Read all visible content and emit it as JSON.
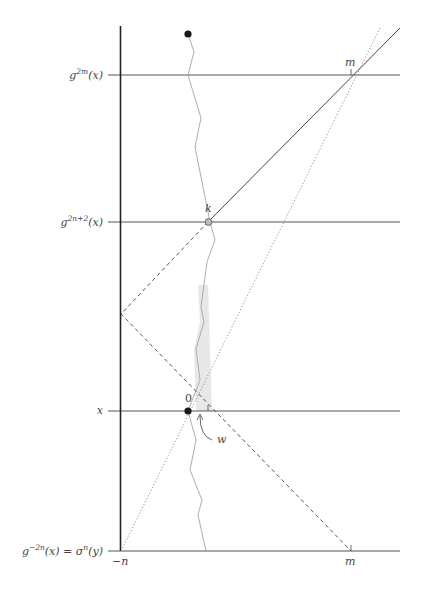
{
  "diagram": {
    "row_labels": [
      {
        "id": "g2m",
        "base": "g",
        "sup": "2m",
        "tail": "(x)",
        "y": 75
      },
      {
        "id": "g2n2",
        "base": "g",
        "sup": "2n+2",
        "tail": "(x)",
        "y": 222
      },
      {
        "id": "x",
        "base": "x",
        "sup": "",
        "tail": "",
        "y": 411
      },
      {
        "id": "bottom",
        "base": "g",
        "sup": "−2n",
        "tail": "(x) = σ",
        "sup2": "n",
        "tail2": "(y)",
        "y": 551
      }
    ],
    "point_labels": {
      "m_top": "m",
      "k": "k",
      "zero": "0",
      "w": "w",
      "neg_n": "−n",
      "m_bottom": "m"
    },
    "colors": {
      "axis": "#222222",
      "hline": "#555555",
      "wavy": "#9a9a9a",
      "shade": "#e6e6e6",
      "dot": "#1a1a1a",
      "open_dot_fill": "#bdbdbd",
      "dashed": "#555555",
      "dotted": "#888888"
    }
  }
}
